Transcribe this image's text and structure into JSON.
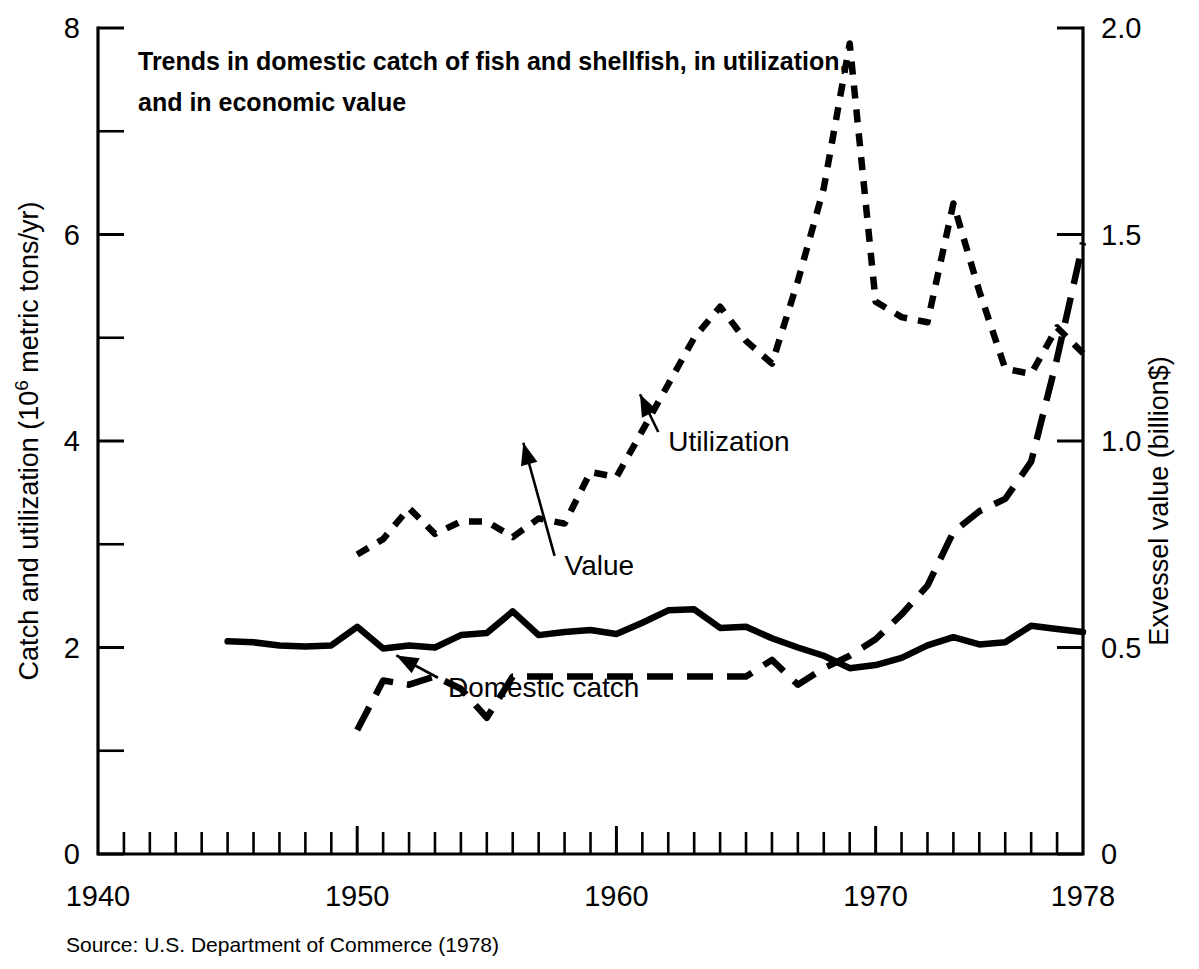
{
  "chart_data": {
    "type": "line",
    "title_line1": "Trends in domestic catch of fish and shellfish, in utilization,",
    "title_line2": "and in economic value",
    "xlabel": "",
    "ylabel": "Catch and utilization (10",
    "ylabel_sup": "6",
    "ylabel_tail": " metric tons/yr)",
    "ylabel_right": "Exvessel value (billion$)",
    "xlim": [
      1940,
      1978
    ],
    "ylim": [
      0,
      8
    ],
    "ylim_right": [
      0,
      2.0
    ],
    "grid": false,
    "legend": "annotations on curves",
    "source": "Source:  U.S. Department of Commerce (1978)",
    "xticks": [
      1940,
      1950,
      1960,
      1970,
      1978
    ],
    "xtick_labels": [
      "1940",
      "1950",
      "1960",
      "1970",
      "1978"
    ],
    "xtick_minor_step": 1,
    "yticks_left": [
      0,
      2,
      4,
      6,
      8
    ],
    "ytick_labels_left": [
      "0",
      "2",
      "4",
      "6",
      "8"
    ],
    "yticks_left_minor": [
      1,
      3,
      5,
      7
    ],
    "yticks_right": [
      0,
      0.5,
      1.0,
      1.5,
      2.0
    ],
    "ytick_labels_right": [
      "0",
      "0.5",
      "1.0",
      "1.5",
      "2.0"
    ],
    "annotations": [
      {
        "text": "Utilization",
        "x": 1962,
        "y": 4.0,
        "point_x": 1960.6,
        "point_y": 4.55
      },
      {
        "text": "Domestic catch",
        "x": 1953.5,
        "y": 1.62,
        "point_x": 1951.2,
        "point_y": 2.02
      },
      {
        "text": "Value",
        "x": 1958.0,
        "y": 0.7,
        "point_x": 1956.1,
        "point_y": 1.02
      }
    ],
    "series": [
      {
        "name": "Domestic catch",
        "style": "solid",
        "axis": "left",
        "unit": "10^6 metric tons/yr",
        "x": [
          1945,
          1946,
          1947,
          1948,
          1949,
          1950,
          1951,
          1952,
          1953,
          1954,
          1955,
          1956,
          1957,
          1958,
          1959,
          1960,
          1961,
          1962,
          1963,
          1964,
          1965,
          1966,
          1967,
          1968,
          1969,
          1970,
          1971,
          1972,
          1973,
          1974,
          1975,
          1976,
          1977,
          1978
        ],
        "values": [
          2.06,
          2.05,
          2.02,
          2.01,
          2.02,
          2.2,
          1.99,
          2.02,
          2.0,
          2.12,
          2.14,
          2.35,
          2.12,
          2.15,
          2.17,
          2.13,
          2.24,
          2.36,
          2.37,
          2.19,
          2.2,
          2.09,
          2.0,
          1.92,
          1.8,
          1.83,
          1.9,
          2.02,
          2.1,
          2.03,
          2.05,
          2.21,
          2.18,
          2.15
        ]
      },
      {
        "name": "Utilization",
        "style": "dashed-short",
        "axis": "left",
        "unit": "10^6 metric tons/yr",
        "x": [
          1950,
          1951,
          1952,
          1953,
          1954,
          1955,
          1956,
          1957,
          1958,
          1959,
          1960,
          1961,
          1962,
          1963,
          1964,
          1965,
          1966,
          1967,
          1968,
          1969,
          1970,
          1971,
          1972,
          1973,
          1974,
          1975,
          1976,
          1977,
          1978
        ],
        "values": [
          2.9,
          3.05,
          3.35,
          3.1,
          3.22,
          3.22,
          3.07,
          3.25,
          3.2,
          3.7,
          3.65,
          4.1,
          4.55,
          5.0,
          5.3,
          4.97,
          4.75,
          5.55,
          6.45,
          7.85,
          5.35,
          5.2,
          5.15,
          6.3,
          5.45,
          4.7,
          4.65,
          5.1,
          4.85
        ]
      },
      {
        "name": "Value",
        "style": "dashed-long",
        "axis": "right",
        "unit": "billion$",
        "x": [
          1950,
          1951,
          1952,
          1953,
          1954,
          1955,
          1956,
          1957,
          1958,
          1959,
          1960,
          1961,
          1962,
          1963,
          1964,
          1965,
          1966,
          1967,
          1968,
          1969,
          1970,
          1971,
          1972,
          1973,
          1974,
          1975,
          1976,
          1977,
          1978
        ],
        "values": [
          0.3,
          0.42,
          0.41,
          0.43,
          0.4,
          0.33,
          0.43,
          0.43,
          0.43,
          0.43,
          0.43,
          0.43,
          0.43,
          0.43,
          0.43,
          0.43,
          0.47,
          0.41,
          0.45,
          0.48,
          0.52,
          0.58,
          0.65,
          0.78,
          0.83,
          0.86,
          0.95,
          1.2,
          1.48
        ]
      }
    ]
  }
}
